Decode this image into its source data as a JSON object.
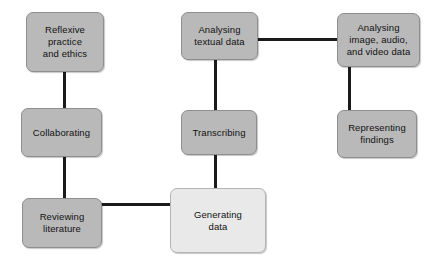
{
  "diagram": {
    "background_color": "#ffffff",
    "node_fill_color": "#b9b9b9",
    "node_fill_color_highlight": "#e9e9e9",
    "node_border_color": "#8e8e8e",
    "connector_color": "#1b1b1b",
    "nodes": [
      {
        "id": "reflexive-practice-and-ethics",
        "label": "Reflexive\npractice\nand ethics",
        "x": 26,
        "y": 12,
        "w": 78,
        "h": 60,
        "style": "filled"
      },
      {
        "id": "analysing-textual-data",
        "label": "Analysing\ntextual data",
        "x": 181,
        "y": 12,
        "w": 77,
        "h": 48,
        "style": "filled"
      },
      {
        "id": "analysing-image-audio-and-video-data",
        "label": "Analysing\nimage, audio,\nand video data",
        "x": 337,
        "y": 13,
        "w": 83,
        "h": 54,
        "style": "filled"
      },
      {
        "id": "collaborating",
        "label": "Collaborating",
        "x": 21,
        "y": 108,
        "w": 81,
        "h": 49,
        "style": "filled"
      },
      {
        "id": "transcribing",
        "label": "Transcribing",
        "x": 181,
        "y": 110,
        "w": 76,
        "h": 45,
        "style": "filled"
      },
      {
        "id": "representing-findings",
        "label": "Representing\nfindings",
        "x": 337,
        "y": 110,
        "w": 80,
        "h": 48,
        "style": "filled"
      },
      {
        "id": "reviewing-literature",
        "label": "Reviewing\nliterature",
        "x": 22,
        "y": 198,
        "w": 80,
        "h": 50,
        "style": "filled"
      },
      {
        "id": "generating-data",
        "label": "Generating\ndata",
        "x": 170,
        "y": 188,
        "w": 96,
        "h": 65,
        "style": "highlight"
      }
    ],
    "connectors": [
      {
        "id": "reflexive-to-collaborating",
        "orientation": "v",
        "x": 63,
        "y": 72,
        "length": 37
      },
      {
        "id": "collaborating-to-reviewing-literature",
        "orientation": "v",
        "x": 63,
        "y": 157,
        "length": 42
      },
      {
        "id": "reviewing-literature-to-generating-data",
        "orientation": "h",
        "x": 100,
        "y": 203,
        "length": 72
      },
      {
        "id": "analysing-textual-to-analysing-image",
        "orientation": "h",
        "x": 256,
        "y": 38,
        "length": 82
      },
      {
        "id": "analysing-textual-to-transcribing",
        "orientation": "v",
        "x": 214,
        "y": 60,
        "length": 51
      },
      {
        "id": "transcribing-to-generating-data",
        "orientation": "v",
        "x": 214,
        "y": 155,
        "length": 34
      },
      {
        "id": "analysing-image-to-representing-findings",
        "orientation": "v",
        "x": 348,
        "y": 67,
        "length": 44
      }
    ]
  }
}
